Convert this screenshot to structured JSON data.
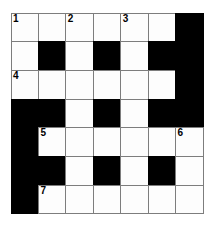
{
  "puzzle": {
    "title": "Crossword Grid",
    "type": "crossword",
    "rows": 7,
    "columns": 7,
    "colors": {
      "background": "#ffffff",
      "white_cell": "#fdfdfd",
      "black_cell": "#000000",
      "grid_line": "#7d7d7d",
      "number_text": "#000000"
    },
    "grid": [
      [
        {
          "state": "white",
          "number": "1"
        },
        {
          "state": "white",
          "number": ""
        },
        {
          "state": "white",
          "number": "2"
        },
        {
          "state": "white",
          "number": ""
        },
        {
          "state": "white",
          "number": "3"
        },
        {
          "state": "white",
          "number": ""
        },
        {
          "state": "black",
          "number": ""
        }
      ],
      [
        {
          "state": "white",
          "number": ""
        },
        {
          "state": "black",
          "number": ""
        },
        {
          "state": "white",
          "number": ""
        },
        {
          "state": "black",
          "number": ""
        },
        {
          "state": "white",
          "number": ""
        },
        {
          "state": "black",
          "number": ""
        },
        {
          "state": "black",
          "number": ""
        }
      ],
      [
        {
          "state": "white",
          "number": "4"
        },
        {
          "state": "white",
          "number": ""
        },
        {
          "state": "white",
          "number": ""
        },
        {
          "state": "white",
          "number": ""
        },
        {
          "state": "white",
          "number": ""
        },
        {
          "state": "white",
          "number": ""
        },
        {
          "state": "black",
          "number": ""
        }
      ],
      [
        {
          "state": "black",
          "number": ""
        },
        {
          "state": "black",
          "number": ""
        },
        {
          "state": "white",
          "number": ""
        },
        {
          "state": "black",
          "number": ""
        },
        {
          "state": "white",
          "number": ""
        },
        {
          "state": "black",
          "number": ""
        },
        {
          "state": "black",
          "number": ""
        }
      ],
      [
        {
          "state": "black",
          "number": ""
        },
        {
          "state": "white",
          "number": "5"
        },
        {
          "state": "white",
          "number": ""
        },
        {
          "state": "white",
          "number": ""
        },
        {
          "state": "white",
          "number": ""
        },
        {
          "state": "white",
          "number": ""
        },
        {
          "state": "white",
          "number": "6"
        }
      ],
      [
        {
          "state": "black",
          "number": ""
        },
        {
          "state": "black",
          "number": ""
        },
        {
          "state": "white",
          "number": ""
        },
        {
          "state": "black",
          "number": ""
        },
        {
          "state": "white",
          "number": ""
        },
        {
          "state": "black",
          "number": ""
        },
        {
          "state": "white",
          "number": ""
        }
      ],
      [
        {
          "state": "black",
          "number": ""
        },
        {
          "state": "white",
          "number": "7"
        },
        {
          "state": "white",
          "number": ""
        },
        {
          "state": "white",
          "number": ""
        },
        {
          "state": "white",
          "number": ""
        },
        {
          "state": "white",
          "number": ""
        },
        {
          "state": "white",
          "number": ""
        }
      ]
    ]
  }
}
